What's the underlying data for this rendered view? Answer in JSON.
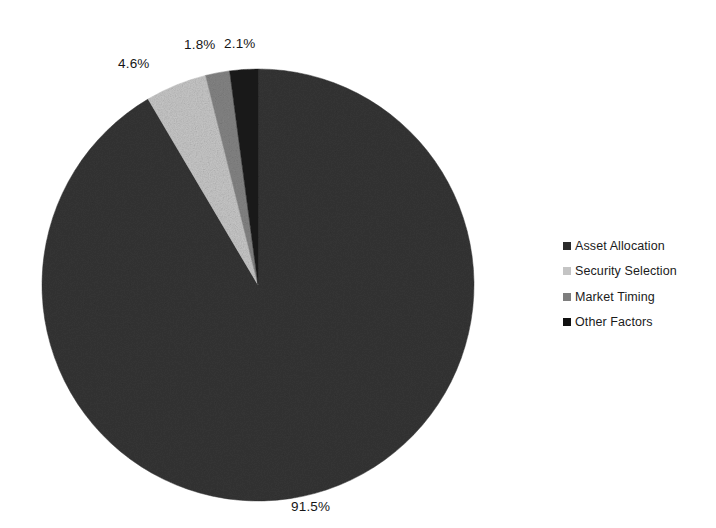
{
  "chart_data": {
    "type": "pie",
    "title": "",
    "subtitle": "",
    "xlabel": "",
    "ylabel": "",
    "legend_position": "right",
    "grid": false,
    "start_angle_deg": 0,
    "direction": "clockwise",
    "categories": [
      "Asset Allocation",
      "Security Selection",
      "Market Timing",
      "Other Factors"
    ],
    "values": [
      91.5,
      4.6,
      1.8,
      2.1
    ],
    "value_labels": [
      "91.5%",
      "4.6%",
      "1.8%",
      "2.1%"
    ],
    "colors": [
      "#2b2b2b",
      "#c4c4c4",
      "#7e7e7e",
      "#111111"
    ],
    "slices": [
      {
        "label": "Asset Allocation",
        "value": 91.5,
        "value_label": "91.5%",
        "color": "#2b2b2b"
      },
      {
        "label": "Security Selection",
        "value": 4.6,
        "value_label": "4.6%",
        "color": "#c4c4c4"
      },
      {
        "label": "Market Timing",
        "value": 1.8,
        "value_label": "1.8%",
        "color": "#7e7e7e"
      },
      {
        "label": "Other Factors",
        "value": 2.1,
        "value_label": "2.1%",
        "color": "#111111"
      }
    ]
  },
  "legend": {
    "items": [
      {
        "label": "Asset Allocation",
        "color": "#2b2b2b"
      },
      {
        "label": "Security Selection",
        "color": "#c4c4c4"
      },
      {
        "label": "Market Timing",
        "color": "#7e7e7e"
      },
      {
        "label": "Other Factors",
        "color": "#111111"
      }
    ]
  },
  "labels": {
    "asset_allocation": "91.5%",
    "security_selection": "4.6%",
    "market_timing": "1.8%",
    "other_factors": "2.1%"
  }
}
